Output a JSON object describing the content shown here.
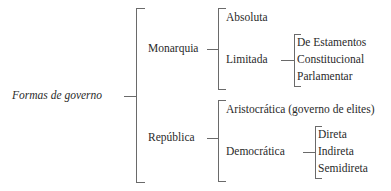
{
  "diagram": {
    "root": "Formas de governo",
    "branches": [
      {
        "label": "Monarquia",
        "children": [
          {
            "label": "Absoluta"
          },
          {
            "label": "Limitada",
            "children": [
              "De Estamentos",
              "Constitucional",
              "Parlamentar"
            ]
          }
        ]
      },
      {
        "label": "República",
        "children": [
          {
            "label": "Aristocrática (governo de elites)"
          },
          {
            "label": "Democrática",
            "children": [
              "Direta",
              "Indireta",
              "Semidireta"
            ]
          }
        ]
      }
    ]
  }
}
